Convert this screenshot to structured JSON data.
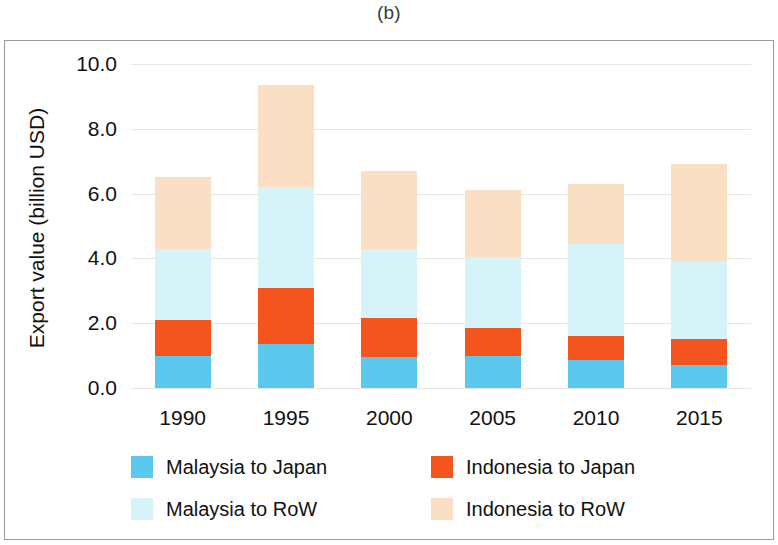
{
  "figure": {
    "title": "(b)"
  },
  "chart_data": {
    "type": "bar",
    "subtype": "stacked-vertical",
    "title": "(b)",
    "xlabel": "",
    "ylabel": "Export value (billion USD)",
    "categories": [
      "1990",
      "1995",
      "2000",
      "2005",
      "2010",
      "2015"
    ],
    "ylim": [
      0.0,
      10.0
    ],
    "ytick_labels": [
      "0.0",
      "2.0",
      "4.0",
      "6.0",
      "8.0",
      "10.0"
    ],
    "ytick_values": [
      0.0,
      2.0,
      4.0,
      6.0,
      8.0,
      10.0
    ],
    "grid": true,
    "grid_axis": "y",
    "legend_position": "bottom",
    "series": [
      {
        "name": "Malaysia to Japan",
        "color": "#5BC9EE",
        "values": [
          1.0,
          1.35,
          0.95,
          1.0,
          0.85,
          0.7
        ]
      },
      {
        "name": "Indonesia to Japan",
        "color": "#F4551F",
        "values": [
          1.1,
          1.75,
          1.2,
          0.85,
          0.75,
          0.8
        ]
      },
      {
        "name": "Malaysia to RoW",
        "color": "#D6F3FA",
        "values": [
          2.2,
          3.1,
          2.15,
          2.2,
          2.85,
          2.4
        ]
      },
      {
        "name": "Indonesia to RoW",
        "color": "#FADFC5",
        "values": [
          2.2,
          3.15,
          2.4,
          2.05,
          1.85,
          3.0
        ]
      }
    ],
    "totals": [
      6.5,
      9.35,
      6.7,
      6.1,
      6.3,
      6.9
    ]
  }
}
